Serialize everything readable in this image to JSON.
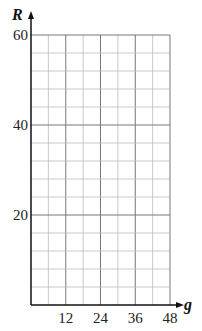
{
  "chart_data": {
    "type": "line",
    "title": "",
    "xlabel": "g",
    "ylabel": "R",
    "xlim": [
      0,
      48
    ],
    "ylim": [
      0,
      60
    ],
    "x_ticks": [
      12,
      24,
      36,
      48
    ],
    "y_ticks": [
      20,
      40,
      60
    ],
    "x_minor_step": 6,
    "y_minor_step": 4,
    "grid": true,
    "series": [],
    "note": "Blank grid with no plotted data"
  },
  "labels": {
    "x_axis": "g",
    "y_axis": "R",
    "x_tick_labels": [
      "12",
      "24",
      "36",
      "48"
    ],
    "y_tick_labels": [
      "20",
      "40",
      "60"
    ]
  },
  "colors": {
    "axis": "#111111",
    "major_grid": "#777777",
    "minor_grid": "#bbbbbb"
  }
}
